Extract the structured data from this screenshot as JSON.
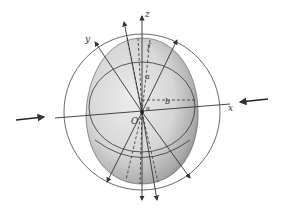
{
  "figure": {
    "labels": {
      "z_axis": "z",
      "y_axis": "y",
      "x_axis": "x",
      "origin": "O",
      "semi_axis_a": "a",
      "semi_axis_b": "b",
      "top_point": "f",
      "small_angle": "α"
    },
    "colors": {
      "ellipsoid_fill_light": "#e6e6e6",
      "ellipsoid_fill_dark": "#8a8a8a",
      "line": "#3a3a3a",
      "background": "#ffffff"
    }
  }
}
